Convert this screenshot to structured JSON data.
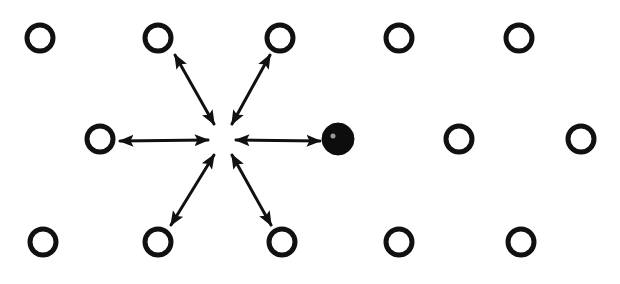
{
  "diagram": {
    "colors": {
      "ink": "#111111",
      "background": "#ffffff",
      "solute": "#0d0d0d"
    },
    "lattice_rows": [
      {
        "row": 1,
        "sites": [
          "atom",
          "atom",
          "atom",
          "atom",
          "atom"
        ]
      },
      {
        "row": 2,
        "sites": [
          "atom",
          "vacancy",
          "solute",
          "atom",
          "atom"
        ]
      },
      {
        "row": 3,
        "sites": [
          "atom",
          "atom",
          "atom",
          "atom",
          "atom"
        ]
      }
    ],
    "vacancy": {
      "row": 2,
      "index": 1
    },
    "jump_arrows": [
      {
        "to_neighbor": "upper-left",
        "type": "double-headed"
      },
      {
        "to_neighbor": "upper-right",
        "type": "double-headed"
      },
      {
        "to_neighbor": "left",
        "type": "double-headed"
      },
      {
        "to_neighbor": "right (solute)",
        "type": "double-headed"
      },
      {
        "to_neighbor": "lower-left",
        "type": "double-headed"
      },
      {
        "to_neighbor": "lower-right",
        "type": "double-headed"
      }
    ],
    "legend": {
      "open_circle": "host atom",
      "filled_circle": "solute atom",
      "empty_site": "vacancy"
    }
  }
}
